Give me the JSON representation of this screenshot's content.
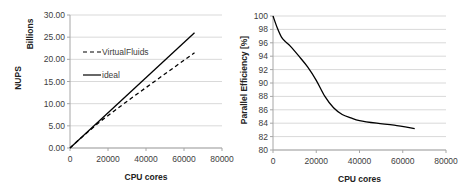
{
  "chart_data": [
    {
      "type": "line",
      "title": "",
      "xlabel": "CPU cores",
      "ylabel": "NUPS",
      "ylabel_units": "Billions",
      "xlim": [
        0,
        80000
      ],
      "ylim": [
        0,
        30
      ],
      "x_ticks": [
        "0",
        "20000",
        "40000",
        "60000",
        "80000"
      ],
      "y_ticks": [
        "0.00",
        "5.00",
        "10.00",
        "15.00",
        "20.00",
        "25.00",
        "30.00"
      ],
      "grid": "horizontal",
      "legend_position": "upper-left inside",
      "series": [
        {
          "name": "VirtualFluids",
          "style": "dashed",
          "x": [
            0,
            4096,
            8192,
            16384,
            32768,
            65536
          ],
          "y": [
            0,
            1.62,
            3.18,
            6.15,
            11.4,
            21.5
          ]
        },
        {
          "name": "ideal",
          "style": "solid",
          "x": [
            0,
            65536
          ],
          "y": [
            0,
            26.0
          ]
        }
      ]
    },
    {
      "type": "line",
      "title": "",
      "xlabel": "CPU cores",
      "ylabel": "Parallel Efficiency [%]",
      "xlim": [
        0,
        80000
      ],
      "ylim": [
        80,
        100
      ],
      "x_ticks": [
        "0",
        "20000",
        "40000",
        "60000",
        "80000"
      ],
      "y_ticks": [
        "80",
        "82",
        "84",
        "86",
        "88",
        "90",
        "92",
        "94",
        "96",
        "98",
        "100"
      ],
      "grid": "horizontal",
      "legend_position": "none",
      "series": [
        {
          "name": "Parallel Efficiency",
          "style": "solid",
          "x": [
            0,
            2000,
            4000,
            6000,
            8000,
            12000,
            16000,
            20000,
            24000,
            28000,
            32000,
            36000,
            40000,
            48000,
            56000,
            65536
          ],
          "y": [
            100,
            98.2,
            96.8,
            96.1,
            95.5,
            94.0,
            92.4,
            90.4,
            88.0,
            86.3,
            85.3,
            84.8,
            84.4,
            84.0,
            83.7,
            83.2
          ]
        }
      ]
    }
  ],
  "left": {
    "units_label": "Billions",
    "ylabel": "NUPS",
    "xlabel": "CPU cores",
    "legend": [
      "VirtualFluids",
      "ideal"
    ]
  },
  "right": {
    "ylabel": "Parallel Efficiency [%]",
    "xlabel": "CPU cores"
  }
}
